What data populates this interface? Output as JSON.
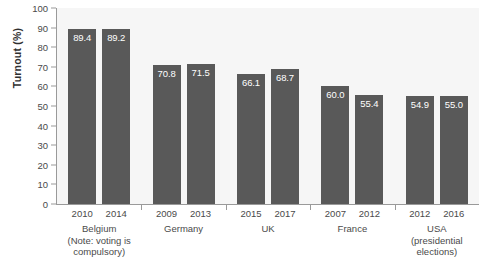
{
  "chart_data": {
    "type": "bar",
    "title": "",
    "xlabel": "",
    "ylabel": "Turnout (%)",
    "ylim": [
      0,
      100
    ],
    "yticks": [
      0,
      10,
      20,
      30,
      40,
      50,
      60,
      70,
      80,
      90,
      100
    ],
    "grid": false,
    "legend": "none",
    "bar_color": "#595959",
    "plot_background": "#f6f6f6",
    "value_label_color": "#ffffff",
    "categories": [
      "2010",
      "2014",
      "2009",
      "2013",
      "2015",
      "2017",
      "2007",
      "2012",
      "2012",
      "2016"
    ],
    "values": [
      89.4,
      89.2,
      70.8,
      71.5,
      66.1,
      68.7,
      60.0,
      55.4,
      54.9,
      55.0
    ],
    "value_labels": [
      "89.4",
      "89.2",
      "70.8",
      "71.5",
      "66.1",
      "68.7",
      "60.0",
      "55.4",
      "54.9",
      "55.0"
    ],
    "groups": [
      {
        "name": "Belgium",
        "lines": [
          "Belgium",
          "(Note: voting is",
          "compulsory)"
        ],
        "bars": [
          {
            "year": "2010",
            "value": 89.4,
            "label": "89.4"
          },
          {
            "year": "2014",
            "value": 89.2,
            "label": "89.2"
          }
        ]
      },
      {
        "name": "Germany",
        "lines": [
          "Germany"
        ],
        "bars": [
          {
            "year": "2009",
            "value": 70.8,
            "label": "70.8"
          },
          {
            "year": "2013",
            "value": 71.5,
            "label": "71.5"
          }
        ]
      },
      {
        "name": "UK",
        "lines": [
          "UK"
        ],
        "bars": [
          {
            "year": "2015",
            "value": 66.1,
            "label": "66.1"
          },
          {
            "year": "2017",
            "value": 68.7,
            "label": "68.7"
          }
        ]
      },
      {
        "name": "France",
        "lines": [
          "France"
        ],
        "bars": [
          {
            "year": "2007",
            "value": 60.0,
            "label": "60.0"
          },
          {
            "year": "2012",
            "value": 55.4,
            "label": "55.4"
          }
        ]
      },
      {
        "name": "USA",
        "lines": [
          "USA",
          "(presidential",
          "elections)"
        ],
        "bars": [
          {
            "year": "2012",
            "value": 54.9,
            "label": "54.9"
          },
          {
            "year": "2016",
            "value": 55.0,
            "label": "55.0"
          }
        ]
      }
    ]
  }
}
